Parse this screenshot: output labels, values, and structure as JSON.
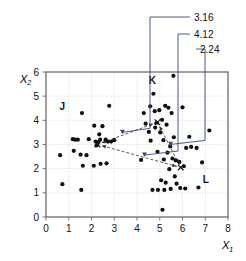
{
  "chart_data": {
    "type": "scatter",
    "title": "",
    "xlabel": "X1",
    "ylabel": "X2",
    "xlim": [
      0,
      8
    ],
    "ylim": [
      0,
      6
    ],
    "xticks": [
      "0",
      "1",
      "2",
      "3",
      "4",
      "5",
      "6",
      "7",
      "8"
    ],
    "yticks": [
      "0",
      "1",
      "2",
      "3",
      "4",
      "5",
      "6"
    ],
    "grid": true,
    "legend": "none",
    "annotations": [
      {
        "label": "3.16",
        "target_x": 3.36,
        "target_y": 3.42
      },
      {
        "label": "4.12",
        "target_x": 4.33,
        "target_y": 2.48
      },
      {
        "label": "2.24",
        "target_x": 5.48,
        "target_y": 2.92
      }
    ],
    "cluster_labels": [
      {
        "label": "J",
        "x": 0.72,
        "y": 4.42
      },
      {
        "label": "K",
        "x": 4.68,
        "y": 5.52
      },
      {
        "label": "L",
        "x": 7.02,
        "y": 1.4
      }
    ],
    "centroids": [
      {
        "name": "J",
        "x": 2.26,
        "y": 3.0
      },
      {
        "name": "K",
        "x": 4.9,
        "y": 3.92
      },
      {
        "name": "L",
        "x": 5.92,
        "y": 2.05
      }
    ],
    "connectors": [
      {
        "from": "J",
        "to": "K",
        "distance": "3.16"
      },
      {
        "from": "J",
        "to": "L",
        "distance": "4.12"
      },
      {
        "from": "K",
        "to": "L",
        "distance": "2.24"
      }
    ],
    "series": [
      {
        "name": "observations",
        "marker": "filled-circle",
        "color": "#111111",
        "points": [
          [
            0.62,
            2.56
          ],
          [
            0.72,
            1.36
          ],
          [
            1.18,
            3.22
          ],
          [
            1.28,
            3.2
          ],
          [
            1.22,
            2.74
          ],
          [
            1.4,
            3.2
          ],
          [
            1.52,
            2.58
          ],
          [
            1.58,
            4.3
          ],
          [
            1.55,
            1.12
          ],
          [
            1.62,
            2.12
          ],
          [
            1.78,
            2.56
          ],
          [
            1.88,
            3.22
          ],
          [
            2.1,
            2.12
          ],
          [
            2.12,
            3.78
          ],
          [
            2.18,
            3.12
          ],
          [
            2.22,
            2.96
          ],
          [
            2.3,
            3.1
          ],
          [
            2.34,
            3.42
          ],
          [
            2.38,
            3.2
          ],
          [
            2.4,
            2.2
          ],
          [
            2.48,
            3.76
          ],
          [
            2.62,
            3.2
          ],
          [
            2.66,
            2.22
          ],
          [
            2.72,
            3.12
          ],
          [
            2.78,
            4.6
          ],
          [
            2.86,
            3.12
          ],
          [
            3.0,
            3.18
          ],
          [
            4.18,
            2.36
          ],
          [
            4.3,
            4.3
          ],
          [
            4.38,
            3.86
          ],
          [
            4.52,
            3.52
          ],
          [
            4.58,
            4.58
          ],
          [
            4.6,
            3.16
          ],
          [
            4.68,
            1.12
          ],
          [
            4.72,
            5.1
          ],
          [
            4.78,
            4.38
          ],
          [
            4.8,
            3.7
          ],
          [
            4.86,
            3.9
          ],
          [
            4.9,
            2.7
          ],
          [
            4.92,
            1.12
          ],
          [
            4.98,
            4.42
          ],
          [
            5.02,
            3.5
          ],
          [
            5.06,
            1.52
          ],
          [
            5.1,
            4.02
          ],
          [
            5.12,
            0.3
          ],
          [
            5.16,
            3.18
          ],
          [
            5.18,
            2.38
          ],
          [
            5.2,
            1.12
          ],
          [
            5.24,
            4.6
          ],
          [
            5.26,
            1.42
          ],
          [
            5.3,
            3.82
          ],
          [
            5.34,
            2.66
          ],
          [
            5.38,
            4.52
          ],
          [
            5.42,
            1.98
          ],
          [
            5.46,
            2.92
          ],
          [
            5.48,
            1.16
          ],
          [
            5.52,
            4.3
          ],
          [
            5.56,
            2.42
          ],
          [
            5.6,
            5.84
          ],
          [
            5.62,
            3.3
          ],
          [
            5.66,
            1.68
          ],
          [
            5.7,
            2.34
          ],
          [
            5.74,
            1.38
          ],
          [
            5.86,
            2.28
          ],
          [
            5.9,
            1.2
          ],
          [
            6.0,
            4.54
          ],
          [
            6.06,
            2.1
          ],
          [
            6.12,
            1.18
          ],
          [
            6.16,
            2.86
          ],
          [
            6.3,
            3.32
          ],
          [
            6.38,
            2.9
          ],
          [
            6.62,
            2.86
          ],
          [
            6.7,
            1.22
          ],
          [
            6.86,
            2.26
          ],
          [
            7.18,
            3.58
          ]
        ]
      }
    ]
  }
}
